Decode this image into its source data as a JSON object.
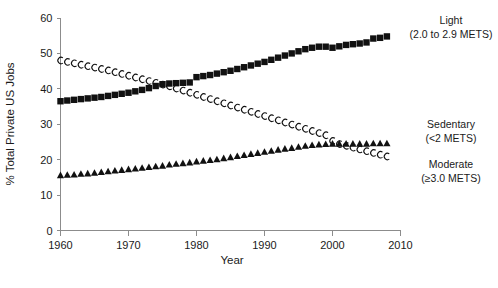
{
  "chart_data": {
    "type": "line",
    "title": "",
    "xlabel": "Year",
    "ylabel": "% Total Private US Jobs",
    "xlim": [
      1960,
      2010
    ],
    "ylim": [
      0,
      60
    ],
    "xticks": [
      1960,
      1970,
      1980,
      1990,
      2000,
      2010
    ],
    "yticks": [
      0,
      10,
      20,
      30,
      40,
      50,
      60
    ],
    "grid": false,
    "legend_position": "right-inline",
    "x": [
      1960,
      1961,
      1962,
      1963,
      1964,
      1965,
      1966,
      1967,
      1968,
      1969,
      1970,
      1971,
      1972,
      1973,
      1974,
      1975,
      1976,
      1977,
      1978,
      1979,
      1980,
      1981,
      1982,
      1983,
      1984,
      1985,
      1986,
      1987,
      1988,
      1989,
      1990,
      1991,
      1992,
      1993,
      1994,
      1995,
      1996,
      1997,
      1998,
      1999,
      2000,
      2001,
      2002,
      2003,
      2004,
      2005,
      2006,
      2007,
      2008
    ],
    "series": [
      {
        "name": "Light",
        "label": "Light",
        "sublabel": "(2.0 to 2.9 METS)",
        "marker": "filled-square",
        "color": "#111111",
        "values": [
          36.5,
          36.7,
          36.9,
          37.1,
          37.3,
          37.5,
          37.7,
          38.0,
          38.3,
          38.6,
          38.9,
          39.3,
          39.7,
          40.2,
          40.8,
          41.3,
          41.5,
          41.6,
          41.7,
          41.8,
          43.3,
          43.6,
          43.9,
          44.3,
          44.7,
          45.1,
          45.6,
          46.1,
          46.6,
          47.1,
          47.6,
          48.2,
          48.8,
          49.4,
          50.0,
          50.6,
          51.2,
          51.6,
          51.9,
          51.9,
          51.6,
          52.0,
          52.4,
          52.6,
          52.8,
          53.1,
          54.2,
          54.4,
          54.8
        ]
      },
      {
        "name": "Sedentary",
        "label": "Sedentary",
        "sublabel": "(<2 METS)",
        "marker": "open-c",
        "color": "#111111",
        "values": [
          48.0,
          47.6,
          47.2,
          46.8,
          46.4,
          46.0,
          45.6,
          45.2,
          44.7,
          44.2,
          43.7,
          43.2,
          42.7,
          42.2,
          41.7,
          41.2,
          40.7,
          40.1,
          39.5,
          38.9,
          38.3,
          37.7,
          37.1,
          36.5,
          35.9,
          35.3,
          34.7,
          34.1,
          33.5,
          32.9,
          32.3,
          31.7,
          31.1,
          30.5,
          29.9,
          29.3,
          28.7,
          28.1,
          27.5,
          26.9,
          25.3,
          24.4,
          23.9,
          23.4,
          22.9,
          22.4,
          21.9,
          21.4,
          20.9
        ]
      },
      {
        "name": "Moderate",
        "label": "Moderate",
        "sublabel": "(≥3.0 METS)",
        "marker": "filled-triangle",
        "color": "#111111",
        "values": [
          15.5,
          15.6,
          15.7,
          15.9,
          16.0,
          16.2,
          16.4,
          16.6,
          16.8,
          17.0,
          17.2,
          17.4,
          17.6,
          17.8,
          18.0,
          18.2,
          18.5,
          18.7,
          18.9,
          19.1,
          19.4,
          19.6,
          19.8,
          20.0,
          20.3,
          20.6,
          20.9,
          21.2,
          21.5,
          21.8,
          22.1,
          22.4,
          22.7,
          23.0,
          23.2,
          23.5,
          23.8,
          24.0,
          24.2,
          24.3,
          24.4,
          24.4,
          24.4,
          24.4,
          24.4,
          24.4,
          24.5,
          24.5,
          24.5
        ]
      }
    ]
  },
  "legend": {
    "light": {
      "label": "Light",
      "sublabel": "(2.0 to 2.9 METS)"
    },
    "sedentary": {
      "label": "Sedentary",
      "sublabel": "(<2 METS)"
    },
    "moderate": {
      "label": "Moderate",
      "sublabel": "(≥3.0 METS)"
    }
  },
  "labels": {
    "xlabel": "Year",
    "ylabel": "% Total Private US Jobs"
  }
}
